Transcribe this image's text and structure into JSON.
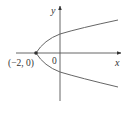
{
  "diagram": {
    "type": "parabola-graph",
    "equation_shape": "parabola opening to the right",
    "labels": {
      "x_axis": "x",
      "y_axis": "y",
      "origin": "0",
      "vertex": "(−2, 0)"
    },
    "vertex_point": [
      -2,
      0
    ],
    "colors": {
      "axis": "#555555",
      "curve": "#666666",
      "point": "#333333",
      "text": "#333333"
    }
  }
}
